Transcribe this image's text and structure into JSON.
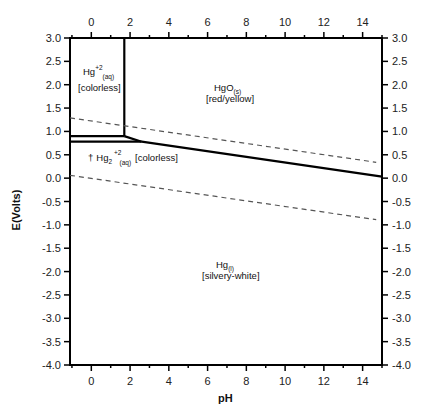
{
  "chart_data": {
    "type": "line",
    "title": "",
    "xlabel": "pH",
    "ylabel": "E(Volts)",
    "xlim": [
      -1.1,
      15.0
    ],
    "ylim": [
      -4.0,
      3.0
    ],
    "x_ticks_major": [
      0,
      2,
      4,
      6,
      8,
      10,
      12,
      14
    ],
    "x_tick_labels": [
      "0",
      "2",
      "4",
      "6",
      "8",
      "10",
      "12",
      "14"
    ],
    "y_ticks_major": [
      3.0,
      2.5,
      2.0,
      1.5,
      1.0,
      0.5,
      0.0,
      -0.5,
      -1.0,
      -1.5,
      -2.0,
      -2.5,
      -3.0,
      -3.5,
      -4.0
    ],
    "y_tick_labels": [
      "3.0",
      "2.5",
      "2.0",
      "1.5",
      "1.0",
      "0.5",
      "0.0",
      "-0.5",
      "-1.0",
      "-1.5",
      "-2.0",
      "-2.5",
      "-3.0",
      "-3.5",
      "-4.0"
    ],
    "grid": false,
    "mirrored_axes": true,
    "series": [
      {
        "name": "Hg2+/HgO boundary (vertical)",
        "style": "solid",
        "points": [
          [
            1.7,
            3.0
          ],
          [
            1.7,
            0.9
          ]
        ]
      },
      {
        "name": "Hg2+/Hg2 2+ boundary",
        "style": "solid",
        "points": [
          [
            -1.1,
            0.9
          ],
          [
            1.7,
            0.9
          ]
        ]
      },
      {
        "name": "Hg2 2+/Hg boundary",
        "style": "solid",
        "points": [
          [
            -1.1,
            0.78
          ],
          [
            2.6,
            0.78
          ]
        ]
      },
      {
        "name": "HgO/Hg2 2+ boundary",
        "style": "solid",
        "points": [
          [
            1.7,
            0.9
          ],
          [
            2.6,
            0.78
          ]
        ]
      },
      {
        "name": "HgO/Hg boundary",
        "style": "solid",
        "points": [
          [
            2.6,
            0.78
          ],
          [
            15.0,
            0.03
          ]
        ]
      },
      {
        "name": "O2/H2O water stability",
        "style": "dashed",
        "points": [
          [
            -1.1,
            1.29
          ],
          [
            14.7,
            0.34
          ]
        ]
      },
      {
        "name": "H2O/H2 water stability",
        "style": "dashed",
        "points": [
          [
            -1.1,
            0.06
          ],
          [
            14.7,
            -0.89
          ]
        ]
      }
    ],
    "annotations": [
      {
        "species": "Hg",
        "charge": "+2",
        "phase": "(aq)",
        "color": "[colorless]",
        "x": 0.2,
        "y": 2.2
      },
      {
        "species": "HgO",
        "phase": "(s)",
        "color": "[red/yellow]",
        "x": 7.0,
        "y": 1.9
      },
      {
        "species": "† Hg2",
        "charge": "+2",
        "phase": "(aq)",
        "color": "[colorless]",
        "x": 3.0,
        "y": 0.45
      },
      {
        "species": "Hg",
        "phase": "(l)",
        "color": "[silvery-white]",
        "x": 7.0,
        "y": -1.95
      }
    ]
  },
  "labels": {
    "xlabel": "pH",
    "ylabel": "E(Volts)",
    "hg2": {
      "main": "Hg",
      "sup": "+2",
      "sub": "(aq)",
      "color": "[colorless]"
    },
    "hgo": {
      "main": "HgO",
      "sub": "(s)",
      "color": "[red/yellow]"
    },
    "hg22": {
      "dagger": "†",
      "main": "Hg",
      "sub1": "2",
      "sup": "+2",
      "sub2": "(aq)",
      "color": "[colorless]"
    },
    "hgl": {
      "main": "Hg",
      "sub": "(l)",
      "color": "[silvery-white]"
    }
  }
}
